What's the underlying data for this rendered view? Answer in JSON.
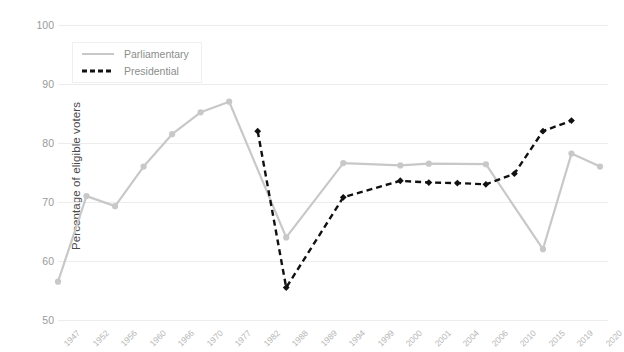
{
  "chart_data": {
    "type": "line",
    "title": "",
    "xlabel": "",
    "ylabel": "Percentage of eligible voters",
    "ylim": [
      50,
      100
    ],
    "yticks": [
      50,
      60,
      70,
      80,
      90,
      100
    ],
    "grid": true,
    "legend_position": "top-left",
    "categories": [
      "1947",
      "1952",
      "1956",
      "1960",
      "1966",
      "1970",
      "1977",
      "1982",
      "1988",
      "1989",
      "1994",
      "1999",
      "2000",
      "2001",
      "2004",
      "2006",
      "2010",
      "2015",
      "2019",
      "2020"
    ],
    "series": [
      {
        "name": "Parliamentary",
        "color": "#c8c8c8",
        "style": "solid",
        "marker": "circle",
        "points": [
          {
            "x": "1947",
            "y": 56.5
          },
          {
            "x": "1952",
            "y": 71.0
          },
          {
            "x": "1956",
            "y": 69.3
          },
          {
            "x": "1960",
            "y": 76.0
          },
          {
            "x": "1966",
            "y": 81.5
          },
          {
            "x": "1970",
            "y": 85.2
          },
          {
            "x": "1977",
            "y": 87.0
          },
          {
            "x": "1988",
            "y": 64.0
          },
          {
            "x": "1994",
            "y": 76.6
          },
          {
            "x": "2000",
            "y": 76.2
          },
          {
            "x": "2001",
            "y": 76.5
          },
          {
            "x": "2006",
            "y": 76.4
          },
          {
            "x": "2015",
            "y": 62.0
          },
          {
            "x": "2019",
            "y": 78.2
          },
          {
            "x": "2020",
            "y": 76.0
          }
        ]
      },
      {
        "name": "Presidential",
        "color": "#111111",
        "style": "dashed",
        "marker": "diamond",
        "points": [
          {
            "x": "1982",
            "y": 82.0
          },
          {
            "x": "1988",
            "y": 55.5
          },
          {
            "x": "1994",
            "y": 70.8
          },
          {
            "x": "2000",
            "y": 73.6
          },
          {
            "x": "2001",
            "y": 73.3
          },
          {
            "x": "2004",
            "y": 73.2
          },
          {
            "x": "2006",
            "y": 73.0
          },
          {
            "x": "2010",
            "y": 74.8
          },
          {
            "x": "2015",
            "y": 82.0
          },
          {
            "x": "2019",
            "y": 83.8
          }
        ]
      }
    ],
    "xtick_labels": [
      {
        "label": "1947",
        "pos": 0
      },
      {
        "label": "1952",
        "pos": 1
      },
      {
        "label": "1956",
        "pos": 2
      },
      {
        "label": "1960",
        "pos": 3
      },
      {
        "label": "1966",
        "pos": 4
      },
      {
        "label": "1970",
        "pos": 5
      },
      {
        "label": "1977",
        "pos": 6
      },
      {
        "label": "1982",
        "pos": 7
      },
      {
        "label": "1988",
        "pos": 8
      },
      {
        "label": "1989",
        "pos": 9
      },
      {
        "label": "1994",
        "pos": 10
      },
      {
        "label": "1999",
        "pos": 11
      },
      {
        "label": "2000",
        "pos": 12
      },
      {
        "label": "2001",
        "pos": 13
      },
      {
        "label": "2004",
        "pos": 14
      },
      {
        "label": "2006",
        "pos": 15
      },
      {
        "label": "2010",
        "pos": 16
      },
      {
        "label": "2015",
        "pos": 17
      },
      {
        "label": "2019",
        "pos": 18
      },
      {
        "label": "2020",
        "pos": 19
      }
    ]
  },
  "legend": {
    "items": [
      {
        "label": "Parliamentary"
      },
      {
        "label": "Presidential"
      }
    ]
  },
  "axes": {
    "y_axis_title": "Percentage of eligible voters"
  }
}
